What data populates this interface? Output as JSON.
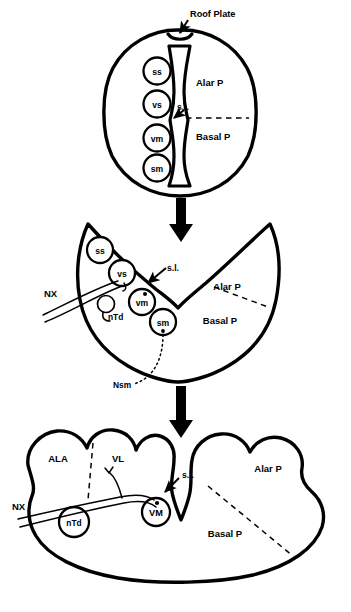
{
  "figure": {
    "type": "schematic-diagram",
    "panel_count": 3,
    "colors": {
      "ink": "#000000",
      "background": "#ffffff"
    }
  },
  "panels": [
    {
      "id": "panel-1",
      "name": "neural-tube-stage",
      "shape": "oval-cross-section",
      "annotations": [
        {
          "name": "roof-plate",
          "label": "Roof Plate",
          "has_arrow": true
        },
        {
          "name": "alar-plate",
          "label": "Alar P"
        },
        {
          "name": "basal-plate",
          "label": "Basal P"
        },
        {
          "name": "sulcus-limitans",
          "label": "s.l.",
          "has_arrow": true
        }
      ],
      "nuclei": [
        {
          "name": "nucleus-ss",
          "label": "ss",
          "plate": "alar"
        },
        {
          "name": "nucleus-vs",
          "label": "vs",
          "plate": "alar"
        },
        {
          "name": "nucleus-vm",
          "label": "vm",
          "plate": "basal"
        },
        {
          "name": "nucleus-sm",
          "label": "sm",
          "plate": "basal"
        }
      ],
      "divider": "horizontal-dashed-line"
    },
    {
      "id": "panel-2",
      "name": "opening-neural-tube-stage",
      "shape": "butterfly-open-tube",
      "annotations": [
        {
          "name": "alar-plate",
          "label": "Alar P"
        },
        {
          "name": "basal-plate",
          "label": "Basal P"
        },
        {
          "name": "sulcus-limitans",
          "label": "s.l.",
          "has_arrow": true
        },
        {
          "name": "vagus-nerve",
          "label": "NX"
        },
        {
          "name": "nucleus-ntd",
          "label": "nTd"
        },
        {
          "name": "nucleus-solitary-tract",
          "label": "Nsm"
        }
      ],
      "nuclei": [
        {
          "name": "nucleus-ss",
          "label": "ss",
          "plate": "alar"
        },
        {
          "name": "nucleus-vs",
          "label": "vs",
          "plate": "alar"
        },
        {
          "name": "nucleus-vm",
          "label": "vm",
          "plate": "basal"
        },
        {
          "name": "nucleus-sm",
          "label": "sm",
          "plate": "basal"
        }
      ],
      "divider": "diagonal-dashed-line"
    },
    {
      "id": "panel-3",
      "name": "mature-medulla-stage",
      "shape": "lobed-open-medulla",
      "annotations": [
        {
          "name": "ala-region",
          "label": "ALA"
        },
        {
          "name": "vl-region",
          "label": "VL"
        },
        {
          "name": "alar-plate",
          "label": "Alar P"
        },
        {
          "name": "basal-plate",
          "label": "Basal P"
        },
        {
          "name": "sulcus-limitans",
          "label": "s.l.",
          "has_arrow": true
        },
        {
          "name": "vagus-nerve",
          "label": "NX"
        },
        {
          "name": "nucleus-ntd",
          "label": "nTd"
        }
      ],
      "nuclei": [
        {
          "name": "nucleus-vm-mature",
          "label": "VM",
          "plate": "basal"
        }
      ],
      "divider": "diagonal-dashed-line"
    }
  ],
  "flow_arrows": [
    {
      "name": "arrow-panel1-to-panel2",
      "direction": "down"
    },
    {
      "name": "arrow-panel2-to-panel3",
      "direction": "down"
    }
  ]
}
